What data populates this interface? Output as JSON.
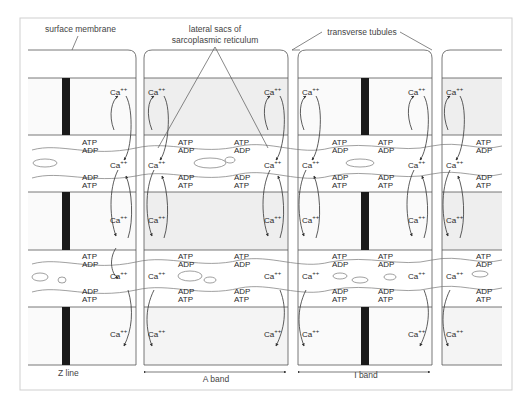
{
  "labels": {
    "surface_membrane": "surface membrane",
    "lateral_sacs_line1": "lateral sacs of",
    "lateral_sacs_line2": "sarcoplasmic reticulum",
    "transverse_tubules": "transverse tubules",
    "z_line": "Z line",
    "a_band": "A band",
    "i_band": "I band"
  },
  "chem": {
    "calcium": "Ca",
    "calcium_charge": "++",
    "atp": "ATP",
    "adp": "ADP"
  },
  "colors": {
    "line": "#555555",
    "shade": "#eeeeee",
    "sr": "#f6f6f6",
    "zline": "#111111",
    "frame": "#bdbdbd"
  }
}
